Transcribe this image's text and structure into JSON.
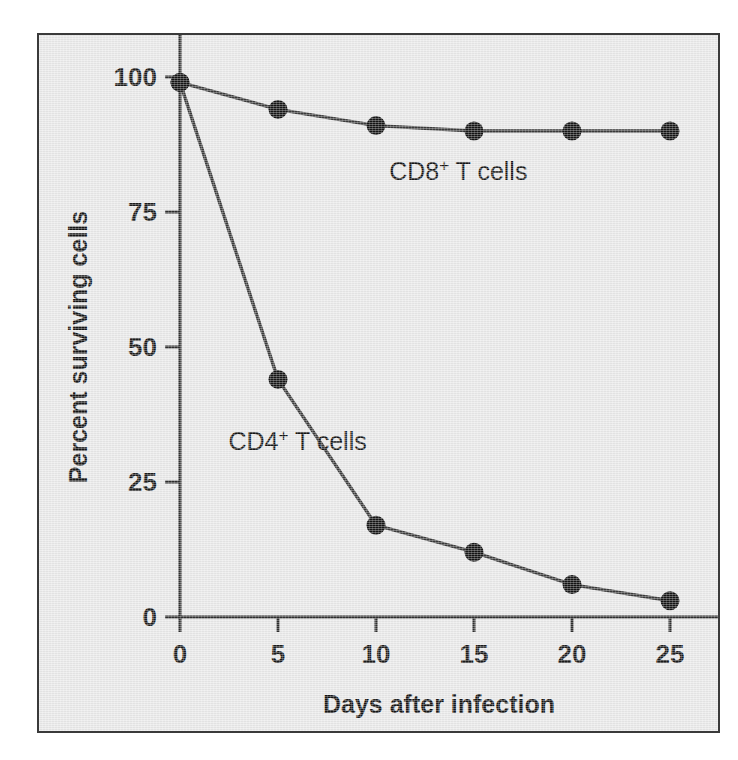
{
  "figure": {
    "background_color": "#e9e9e9",
    "frame_color": "#3a3a3a",
    "line_color": "#3b3b3b",
    "marker_color": "#141414"
  },
  "axes": {
    "x_title": "Days after infection",
    "y_title": "Percent surviving cells",
    "x_ticks": [
      "0",
      "5",
      "10",
      "15",
      "20",
      "25"
    ],
    "y_ticks": [
      "0",
      "25",
      "50",
      "75",
      "100"
    ]
  },
  "series_labels": {
    "cd8": {
      "base": "CD8",
      "sup": "+",
      "tail": " T cells"
    },
    "cd4": {
      "base": "CD4",
      "sup": "+",
      "tail": " T cells"
    }
  },
  "chart_data": {
    "type": "line",
    "title": "",
    "xlabel": "Days after infection",
    "ylabel": "Percent surviving cells",
    "x": [
      0,
      5,
      10,
      15,
      20,
      25
    ],
    "xlim": [
      0,
      26.5
    ],
    "ylim": [
      0,
      102
    ],
    "xticks": [
      0,
      5,
      10,
      15,
      20,
      25
    ],
    "yticks": [
      0,
      25,
      50,
      75,
      100
    ],
    "grid": false,
    "legend": "inline-annotations",
    "series": [
      {
        "name": "CD8+ T cells",
        "values": [
          99,
          94,
          91,
          90,
          90,
          90
        ],
        "annotation": "CD8+ T cells",
        "annotation_x": 14.2,
        "annotation_y": 81
      },
      {
        "name": "CD4+ T cells",
        "values": [
          99,
          44,
          17,
          12,
          6,
          3
        ],
        "annotation": "CD4+ T cells",
        "annotation_x": 6.0,
        "annotation_y": 31
      }
    ]
  }
}
